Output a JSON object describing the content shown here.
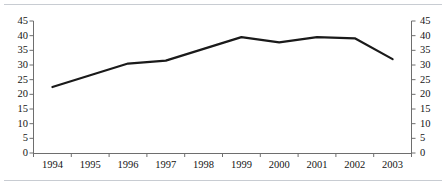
{
  "figure": {
    "background_color": "#ffffff",
    "rule_color": "#c8ccd2",
    "line_color": "#1a1a1a",
    "axis_color": "#6e6e6e"
  },
  "chart_data": {
    "type": "line",
    "title": "",
    "subtitle": "",
    "xlabel": "",
    "ylabel": "",
    "categories": [
      "1994",
      "1995",
      "1996",
      "1997",
      "1998",
      "1999",
      "2000",
      "2001",
      "2002",
      "2003"
    ],
    "series": [
      {
        "name": "",
        "values": [
          22.5,
          26.5,
          30.5,
          31.5,
          35.5,
          39.5,
          37.7,
          39.5,
          39.1,
          32.0
        ]
      }
    ],
    "ylim": [
      0,
      45
    ],
    "y_ticks": [
      0,
      5,
      10,
      15,
      20,
      25,
      30,
      35,
      40,
      45
    ],
    "y_tick_labels_left": [
      "45",
      "40",
      "35",
      "30",
      "25",
      "20",
      "15",
      "10",
      "5",
      "0"
    ],
    "y_tick_labels_right": [
      "45",
      "40",
      "35",
      "30",
      "25",
      "20",
      "15",
      "10",
      "5",
      "0"
    ],
    "x_tick_labels": [
      "1994",
      "1995",
      "1996",
      "1997",
      "1998",
      "1999",
      "2000",
      "2001",
      "2002",
      "2003"
    ],
    "grid": false,
    "legend": [],
    "legend_position": "none",
    "annotations": [],
    "dual_y_axis": true,
    "line_width_px": 2.2,
    "markers": false
  }
}
